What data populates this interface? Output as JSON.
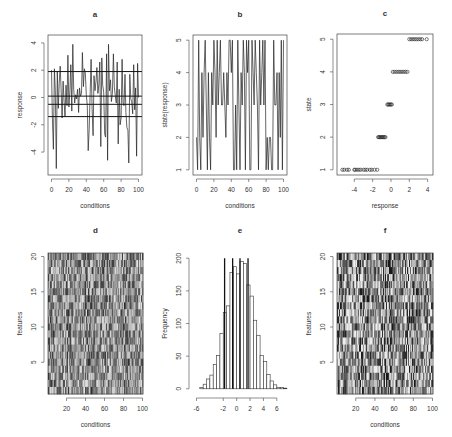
{
  "chart_data": [
    {
      "id": "a",
      "type": "line",
      "title": "a",
      "xlabel": "conditions",
      "ylabel": "response",
      "xlim": [
        0,
        100
      ],
      "ylim": [
        -5.3,
        4.2
      ],
      "xticks": [
        0,
        20,
        40,
        60,
        80,
        100
      ],
      "yticks": [
        -4,
        -2,
        0,
        2,
        4
      ],
      "hlines": [
        1.9,
        0.1,
        -0.5,
        -1.4
      ],
      "y": [
        2.0,
        -1.5,
        -3.8,
        2.1,
        0.5,
        -5.2,
        1.9,
        -0.8,
        1.0,
        2.3,
        0.4,
        -1.5,
        1.2,
        -0.3,
        -1.4,
        0.9,
        -0.6,
        3.1,
        -0.7,
        0.5,
        2.4,
        -1.0,
        3.9,
        0.6,
        -0.4,
        0.2,
        -0.1,
        0.6,
        -1.1,
        0.7,
        0.1,
        0.3,
        3.3,
        0.8,
        2.1,
        1.8,
        0.2,
        -0.6,
        -3.9,
        -2.3,
        0.4,
        2.8,
        -0.8,
        -2.8,
        1.6,
        0.5,
        1.2,
        2.2,
        0.3,
        1.0,
        2.6,
        -3.6,
        2.9,
        0.9,
        0.4,
        -2.7,
        -2.9,
        3.2,
        -4.6,
        3.9,
        0.5,
        1.3,
        -0.3,
        0.3,
        3.2,
        0.8,
        0.1,
        -0.4,
        2.6,
        -3.4,
        0.6,
        -2.0,
        -1.5,
        2.8,
        -0.4,
        -0.6,
        1.7,
        -1.1,
        -2.2,
        -2.4,
        -4.8,
        1.7,
        -0.1,
        -0.3,
        -1.2,
        2.4,
        -0.9,
        0.7,
        -4.3,
        2.5,
        0.0
      ]
    },
    {
      "id": "b",
      "type": "line",
      "title": "b",
      "xlabel": "conditions",
      "ylabel": "state(response)",
      "xlim": [
        0,
        100
      ],
      "ylim": [
        1,
        5
      ],
      "xticks": [
        0,
        20,
        40,
        60,
        80,
        100
      ],
      "yticks": [
        1,
        2,
        3,
        4,
        5
      ],
      "y": [
        2,
        1,
        5,
        2,
        1,
        4,
        2,
        4,
        5,
        3,
        1,
        4,
        2,
        1,
        4,
        3,
        5,
        4,
        2,
        5,
        3,
        4,
        5,
        3,
        3,
        4,
        3,
        2,
        4,
        3,
        5,
        5,
        4,
        5,
        1,
        1,
        3,
        1,
        5,
        3,
        1,
        4,
        3,
        5,
        4,
        1,
        5,
        4,
        5,
        1,
        1,
        5,
        4,
        3,
        5,
        4,
        3,
        1,
        5,
        3,
        4,
        5,
        3,
        5,
        1,
        2,
        1,
        2,
        2,
        1,
        1,
        5,
        3,
        3,
        4,
        1,
        4,
        2,
        5,
        1,
        5
      ]
    },
    {
      "id": "c",
      "type": "scatter",
      "title": "c",
      "xlabel": "response",
      "ylabel": "state",
      "xlim": [
        -5.5,
        4.2
      ],
      "ylim": [
        1,
        5
      ],
      "xticks": [
        -4,
        -2,
        0,
        2,
        4
      ],
      "yticks": [
        1,
        2,
        3,
        4,
        5
      ],
      "points": [
        {
          "state": 1,
          "x": [
            -5.3,
            -5.1,
            -4.8,
            -4.6,
            -4.0,
            -3.9,
            -3.7,
            -3.5,
            -3.3,
            -3.0,
            -2.8,
            -2.6,
            -2.3,
            -2.1,
            -1.8,
            -1.5
          ]
        },
        {
          "state": 2,
          "x": [
            -1.4,
            -1.3,
            -1.2,
            -1.1,
            -1.0,
            -0.9,
            -0.8,
            -0.7,
            -0.6
          ]
        },
        {
          "state": 3,
          "x": [
            -0.4,
            -0.3,
            -0.2,
            -0.1,
            0.0,
            0.1
          ]
        },
        {
          "state": 4,
          "x": [
            0.2,
            0.4,
            0.6,
            0.8,
            1.0,
            1.2,
            1.4,
            1.6,
            1.8
          ]
        },
        {
          "state": 5,
          "x": [
            2.0,
            2.2,
            2.4,
            2.6,
            2.8,
            3.0,
            3.2,
            3.4,
            3.9
          ]
        }
      ]
    },
    {
      "id": "d",
      "type": "heatmap",
      "title": "d",
      "xlabel": "conditions",
      "ylabel": "features",
      "xlim": [
        1,
        100
      ],
      "ylim": [
        1,
        20
      ],
      "xticks": [
        20,
        40,
        60,
        80,
        100
      ],
      "yticks": [
        5,
        10,
        15,
        20
      ],
      "rows": 20,
      "cols": 100,
      "seed": 17,
      "palette": "grayscale"
    },
    {
      "id": "e",
      "type": "bar",
      "title": "e",
      "xlabel": "",
      "ylabel": "Frequency",
      "xlim": [
        -6,
        7
      ],
      "ylim": [
        0,
        200
      ],
      "xticks": [
        -6,
        -2,
        0,
        2,
        4,
        6
      ],
      "yticks": [
        0,
        50,
        100,
        150,
        200
      ],
      "bin_width": 0.5,
      "bin_start": -5.5,
      "values": [
        2,
        7,
        15,
        21,
        37,
        51,
        85,
        117,
        127,
        178,
        187,
        176,
        195,
        192,
        159,
        142,
        105,
        82,
        51,
        42,
        22,
        12,
        6,
        2,
        2,
        1
      ],
      "vlines": [
        -1.8,
        -0.6,
        0.5,
        1.7
      ]
    },
    {
      "id": "f",
      "type": "heatmap",
      "title": "f",
      "xlabel": "conditions",
      "ylabel": "features",
      "xlim": [
        1,
        100
      ],
      "ylim": [
        1,
        20
      ],
      "xticks": [
        20,
        40,
        60,
        80,
        100
      ],
      "yticks": [
        5,
        10,
        15,
        20
      ],
      "rows": 20,
      "cols": 100,
      "seed": 91,
      "palette": "discrete-5"
    }
  ]
}
